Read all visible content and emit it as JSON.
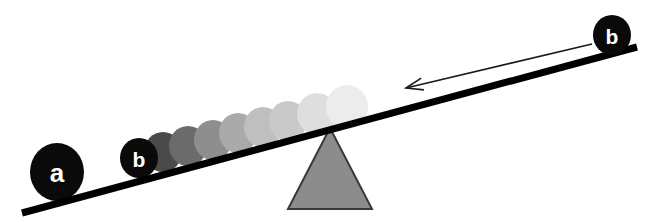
{
  "figure": {
    "background_color": "#ffffff",
    "width": 658,
    "height": 223
  },
  "beam": {
    "name": "lever-beam",
    "color": "#000000",
    "thickness": 7,
    "left_point": [
      22,
      213
    ],
    "right_point": [
      637,
      47
    ]
  },
  "fulcrum": {
    "name": "fulcrum-triangle",
    "fill_color": "#8c8c8c",
    "stroke_color": "#3a3a3a",
    "apex": [
      330,
      128
    ],
    "base_left": [
      288,
      209
    ],
    "base_right": [
      372,
      209
    ]
  },
  "balls": {
    "mass_a": {
      "label": "a",
      "color": "#0a0a0a",
      "label_color": "#ffffff",
      "cx": 57,
      "cy": 172,
      "rx": 27,
      "ry": 29,
      "font_size": 26
    },
    "mass_b_left": {
      "label": "b",
      "color": "#0a0a0a",
      "label_color": "#ffffff",
      "cx": 139,
      "cy": 158,
      "rx": 19,
      "ry": 20,
      "font_size": 21
    },
    "mass_b_right": {
      "label": "b",
      "color": "#0a0a0a",
      "label_color": "#ffffff",
      "cx": 612,
      "cy": 35,
      "rx": 19,
      "ry": 20,
      "font_size": 21
    }
  },
  "trail": {
    "name": "motion-trail",
    "description": "fading ghost copies of mass b sliding toward the left end",
    "count": 8,
    "ghosts": [
      {
        "cx": 163,
        "cy": 152,
        "rx": 19,
        "ry": 20,
        "color": "#4a4a4a"
      },
      {
        "cx": 188,
        "cy": 146,
        "rx": 19,
        "ry": 20,
        "color": "#6b6b6b"
      },
      {
        "cx": 213,
        "cy": 140,
        "rx": 19,
        "ry": 20,
        "color": "#8e8e8e"
      },
      {
        "cx": 238,
        "cy": 133,
        "rx": 19,
        "ry": 20,
        "color": "#aaaaaa"
      },
      {
        "cx": 263,
        "cy": 127,
        "rx": 19,
        "ry": 20,
        "color": "#bfbfbf"
      },
      {
        "cx": 288,
        "cy": 121,
        "rx": 19,
        "ry": 20,
        "color": "#c9c9c9"
      },
      {
        "cx": 317,
        "cy": 114,
        "rx": 20,
        "ry": 21,
        "color": "#dedede"
      },
      {
        "cx": 347,
        "cy": 107,
        "rx": 21,
        "ry": 22,
        "color": "#ececec"
      }
    ]
  },
  "arrow": {
    "name": "motion-arrow",
    "color": "#1a1a1a",
    "direction": "left",
    "tail": [
      592,
      44
    ],
    "tip": [
      406,
      88
    ],
    "stroke_width": 1.6,
    "head_length": 17,
    "head_half_width": 6
  }
}
